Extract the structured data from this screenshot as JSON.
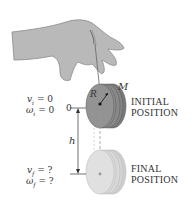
{
  "diagram": {
    "colors": {
      "hand": "#b9b9b9",
      "hand_outline": "#8a8a8a",
      "initial_disk": "#8f8f8f",
      "initial_disk_dark": "#6f6f6f",
      "final_disk": "#dcdcdc",
      "final_disk_edge": "#c4c4c4",
      "text": "#333333",
      "dashed_line": "#999999"
    },
    "labels": {
      "mass": "M",
      "radius": "R",
      "height": "h",
      "zero_level": "0",
      "initial_position_line1": "INITIAL",
      "initial_position_line2": "POSITION",
      "final_position_line1": "FINAL",
      "final_position_line2": "POSITION"
    },
    "initial_conditions": {
      "v": "v",
      "v_sub": "i",
      "v_value": "= 0",
      "omega": "ω",
      "omega_sub": "i",
      "omega_value": "= 0"
    },
    "final_conditions": {
      "v": "v",
      "v_sub": "f",
      "v_value": "= ?",
      "omega": "ω",
      "omega_sub": "f",
      "omega_value": "= ?"
    }
  }
}
